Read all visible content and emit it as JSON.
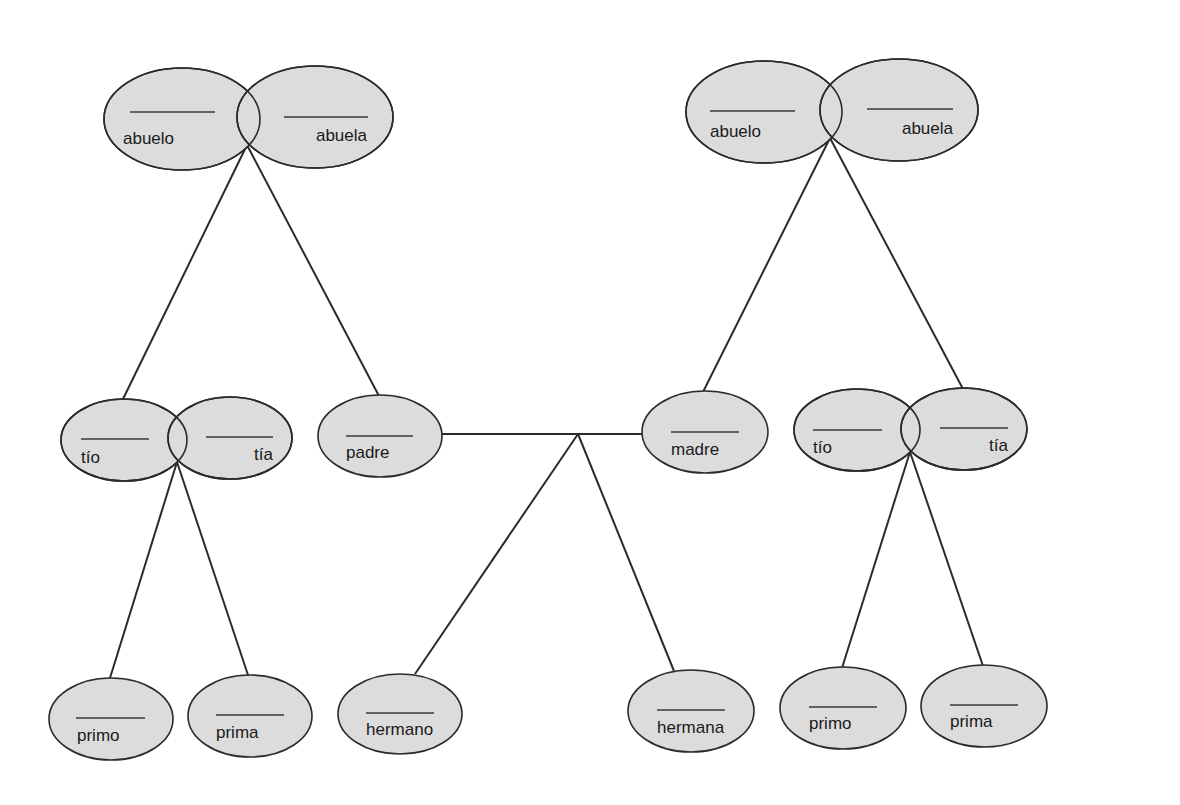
{
  "diagram": {
    "type": "family-tree",
    "fill_color": "#dcdcdc",
    "stroke_color": "#2b2b2b",
    "nodes": [
      {
        "id": "abuelo_pat",
        "label": "abuelo",
        "cx": 182,
        "cy": 119,
        "rx": 78,
        "ry": 51,
        "blank": [
          130,
          215,
          112
        ],
        "text_x": 123,
        "text_y": 144,
        "anchor": "start"
      },
      {
        "id": "abuela_pat",
        "label": "abuela",
        "cx": 315,
        "cy": 117,
        "rx": 78,
        "ry": 51,
        "blank": [
          284,
          368,
          117
        ],
        "text_x": 367,
        "text_y": 141,
        "anchor": "end"
      },
      {
        "id": "abuelo_mat",
        "label": "abuelo",
        "cx": 764,
        "cy": 112,
        "rx": 78,
        "ry": 51,
        "blank": [
          710,
          795,
          111
        ],
        "text_x": 710,
        "text_y": 137,
        "anchor": "start"
      },
      {
        "id": "abuela_mat",
        "label": "abuela",
        "cx": 899,
        "cy": 110,
        "rx": 79,
        "ry": 51,
        "blank": [
          867,
          953,
          109
        ],
        "text_x": 953,
        "text_y": 134,
        "anchor": "end"
      },
      {
        "id": "tio_pat",
        "label": "tío",
        "cx": 124,
        "cy": 440,
        "rx": 63,
        "ry": 41,
        "blank": [
          81,
          149,
          439
        ],
        "text_x": 81,
        "text_y": 463,
        "anchor": "start"
      },
      {
        "id": "tia_pat",
        "label": "tía",
        "cx": 230,
        "cy": 438,
        "rx": 62,
        "ry": 41,
        "blank": [
          206,
          273,
          437
        ],
        "text_x": 273,
        "text_y": 460,
        "anchor": "end"
      },
      {
        "id": "padre",
        "label": "padre",
        "cx": 380,
        "cy": 436,
        "rx": 62,
        "ry": 41,
        "blank": [
          346,
          413,
          436
        ],
        "text_x": 346,
        "text_y": 458,
        "anchor": "start"
      },
      {
        "id": "madre",
        "label": "madre",
        "cx": 705,
        "cy": 432,
        "rx": 63,
        "ry": 41,
        "blank": [
          671,
          739,
          432
        ],
        "text_x": 671,
        "text_y": 455,
        "anchor": "start"
      },
      {
        "id": "tio_mat",
        "label": "tío",
        "cx": 857,
        "cy": 430,
        "rx": 63,
        "ry": 41,
        "blank": [
          813,
          882,
          430
        ],
        "text_x": 813,
        "text_y": 453,
        "anchor": "start"
      },
      {
        "id": "tia_mat",
        "label": "tía",
        "cx": 964,
        "cy": 429,
        "rx": 63,
        "ry": 41,
        "blank": [
          940,
          1008,
          428
        ],
        "text_x": 1008,
        "text_y": 451,
        "anchor": "end"
      },
      {
        "id": "primo_pat",
        "label": "primo",
        "cx": 111,
        "cy": 719,
        "rx": 62,
        "ry": 41,
        "blank": [
          76,
          145,
          718
        ],
        "text_x": 77,
        "text_y": 741,
        "anchor": "start"
      },
      {
        "id": "prima_pat",
        "label": "prima",
        "cx": 250,
        "cy": 716,
        "rx": 62,
        "ry": 41,
        "blank": [
          216,
          284,
          715
        ],
        "text_x": 216,
        "text_y": 738,
        "anchor": "start"
      },
      {
        "id": "hermano",
        "label": "hermano",
        "cx": 400,
        "cy": 714,
        "rx": 62,
        "ry": 40,
        "blank": [
          366,
          434,
          713
        ],
        "text_x": 366,
        "text_y": 735,
        "anchor": "start"
      },
      {
        "id": "hermana",
        "label": "hermana",
        "cx": 691,
        "cy": 711,
        "rx": 63,
        "ry": 41,
        "blank": [
          657,
          725,
          710
        ],
        "text_x": 657,
        "text_y": 733,
        "anchor": "start"
      },
      {
        "id": "primo_mat",
        "label": "primo",
        "cx": 843,
        "cy": 708,
        "rx": 63,
        "ry": 41,
        "blank": [
          809,
          877,
          707
        ],
        "text_x": 809,
        "text_y": 729,
        "anchor": "start"
      },
      {
        "id": "prima_mat",
        "label": "prima",
        "cx": 984,
        "cy": 706,
        "rx": 63,
        "ry": 41,
        "blank": [
          950,
          1018,
          705
        ],
        "text_x": 950,
        "text_y": 727,
        "anchor": "start"
      }
    ],
    "connectors": [
      {
        "from": "abuelos_pat",
        "to": "tio_pat",
        "x1": 247,
        "y1": 145,
        "x2": 123,
        "y2": 399
      },
      {
        "from": "abuelos_pat",
        "to": "padre",
        "x1": 247,
        "y1": 145,
        "x2": 379,
        "y2": 396
      },
      {
        "from": "abuelos_mat",
        "to": "madre",
        "x1": 830,
        "y1": 138,
        "x2": 703,
        "y2": 392
      },
      {
        "from": "abuelos_mat",
        "to": "tia_mat",
        "x1": 830,
        "y1": 138,
        "x2": 963,
        "y2": 389
      },
      {
        "from": "padre",
        "to": "madre",
        "x1": 442,
        "y1": 434,
        "x2": 642,
        "y2": 434
      },
      {
        "from": "padres",
        "to": "hermano",
        "x1": 578,
        "y1": 434,
        "x2": 415,
        "y2": 674
      },
      {
        "from": "padres",
        "to": "hermana",
        "x1": 578,
        "y1": 434,
        "x2": 674,
        "y2": 671
      },
      {
        "from": "tios_pat",
        "to": "primo_pat",
        "x1": 177,
        "y1": 462,
        "x2": 110,
        "y2": 678
      },
      {
        "from": "tios_pat",
        "to": "prima_pat",
        "x1": 177,
        "y1": 462,
        "x2": 248,
        "y2": 675
      },
      {
        "from": "tios_mat",
        "to": "primo_mat",
        "x1": 910,
        "y1": 452,
        "x2": 842,
        "y2": 668
      },
      {
        "from": "tios_mat",
        "to": "prima_mat",
        "x1": 910,
        "y1": 452,
        "x2": 983,
        "y2": 666
      }
    ]
  }
}
